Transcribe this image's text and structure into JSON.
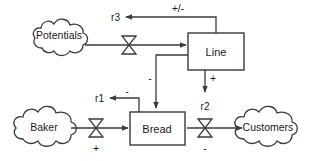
{
  "diagram": {
    "type": "stock-and-flow",
    "background_color": "#ffffff",
    "line_color": "#3a3a3a",
    "text_color": "#1a1a1a",
    "sources": [
      {
        "id": "potentials",
        "label": "Potentials",
        "shape": "cloud"
      },
      {
        "id": "baker",
        "label": "Baker",
        "shape": "cloud"
      },
      {
        "id": "customers",
        "label": "Customers",
        "shape": "cloud"
      }
    ],
    "stocks": [
      {
        "id": "line",
        "label": "Line",
        "shape": "rectangle"
      },
      {
        "id": "bread",
        "label": "Bread",
        "shape": "rectangle"
      }
    ],
    "rates": [
      {
        "id": "r3",
        "label": "r3",
        "shape": "valve",
        "from": "potentials",
        "to": "line"
      },
      {
        "id": "r1",
        "label": "r1",
        "shape": "valve",
        "from": "baker",
        "to": "bread"
      },
      {
        "id": "r2",
        "label": "r2",
        "shape": "valve",
        "from": "bread",
        "to": "customers"
      }
    ],
    "signs": {
      "line_to_r3": "+/-",
      "line_to_bread": "-",
      "line_to_r2": "+",
      "bread_to_r1": "-",
      "r1_polarity": "+",
      "r2_polarity": "-"
    }
  }
}
